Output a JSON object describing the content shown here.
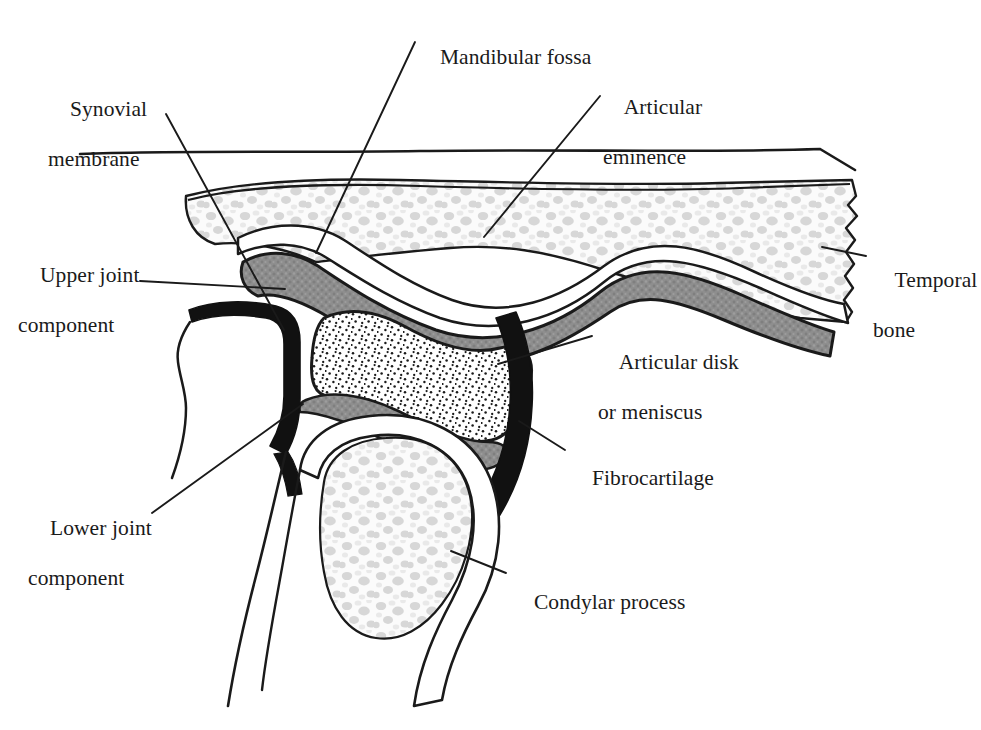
{
  "figure": {
    "background_color": "#ffffff",
    "ink_color": "#1a1a1a"
  },
  "labels": [
    {
      "id": "mandibular-fossa",
      "text": "Mandibular fossa",
      "lines": [
        "Mandibular fossa"
      ],
      "x": 418,
      "y": 20
    },
    {
      "id": "synovial-membrane",
      "text": "Synovial membrane",
      "lines": [
        "Synovial",
        "membrane"
      ],
      "x": 48,
      "y": 72
    },
    {
      "id": "articular-eminence",
      "text": "Articular eminence",
      "lines": [
        "Articular",
        "eminence"
      ],
      "x": 603,
      "y": 70
    },
    {
      "id": "upper-joint-component",
      "text": "Upper joint component",
      "lines": [
        "Upper joint",
        "component"
      ],
      "x": 18,
      "y": 238
    },
    {
      "id": "temporal-bone",
      "text": "Temporal bone",
      "lines": [
        "Temporal",
        "bone"
      ],
      "x": 873,
      "y": 243
    },
    {
      "id": "articular-disk",
      "text": "Articular disk or meniscus",
      "lines": [
        "Articular disk",
        "or meniscus"
      ],
      "x": 598,
      "y": 325
    },
    {
      "id": "fibrocartilage",
      "text": "Fibrocartilage",
      "lines": [
        "Fibrocartilage"
      ],
      "x": 570,
      "y": 441
    },
    {
      "id": "lower-joint-component",
      "text": "Lower joint component",
      "lines": [
        "Lower joint",
        "component"
      ],
      "x": 28,
      "y": 491
    },
    {
      "id": "condylar-process",
      "text": "Condylar process",
      "lines": [
        "Condylar process"
      ],
      "x": 512,
      "y": 565
    }
  ],
  "structures": [
    {
      "id": "skin-line",
      "name": "outer surface line",
      "fill": "none"
    },
    {
      "id": "temporal-bone",
      "name": "temporal bone (cancellous)",
      "fill": "#f6f6f6"
    },
    {
      "id": "articular-eminence-cortex",
      "name": "articular eminence cortical plate",
      "fill": "#ffffff"
    },
    {
      "id": "upper-joint-space",
      "name": "upper joint component / synovial cavity",
      "fill": "#8c8c8c"
    },
    {
      "id": "articular-disk",
      "name": "articular disk or meniscus (stippled)",
      "fill": "#ffffff"
    },
    {
      "id": "lower-joint-space",
      "name": "lower joint component / synovial cavity",
      "fill": "#9a9a9a"
    },
    {
      "id": "fibrocartilage",
      "name": "fibrocartilage capsule band",
      "fill": "#111111"
    },
    {
      "id": "condylar-process",
      "name": "condylar process (cancellous)",
      "fill": "#f6f6f6"
    },
    {
      "id": "mandibular-ramus",
      "name": "mandibular ramus outline",
      "fill": "#ffffff"
    }
  ],
  "leaders": [
    {
      "id": "leader-mandibular-fossa",
      "from": [
        415,
        42
      ],
      "to": [
        316,
        253
      ]
    },
    {
      "id": "leader-synovial-membrane",
      "from": [
        166,
        114
      ],
      "to": [
        282,
        326
      ]
    },
    {
      "id": "leader-articular-eminence",
      "from": [
        600,
        92
      ],
      "to": [
        484,
        237
      ]
    },
    {
      "id": "leader-upper-joint",
      "from": [
        140,
        281
      ],
      "to": [
        283,
        288
      ]
    },
    {
      "id": "leader-temporal-bone",
      "from": [
        866,
        256
      ],
      "to": [
        824,
        248
      ]
    },
    {
      "id": "leader-articular-disk",
      "from": [
        592,
        336
      ],
      "to": [
        503,
        362
      ]
    },
    {
      "id": "leader-fibrocartilage",
      "from": [
        565,
        450
      ],
      "to": [
        519,
        421
      ]
    },
    {
      "id": "leader-lower-joint",
      "from": [
        152,
        513
      ],
      "to": [
        302,
        405
      ]
    },
    {
      "id": "leader-condylar-process",
      "from": [
        506,
        573
      ],
      "to": [
        451,
        551
      ]
    }
  ]
}
